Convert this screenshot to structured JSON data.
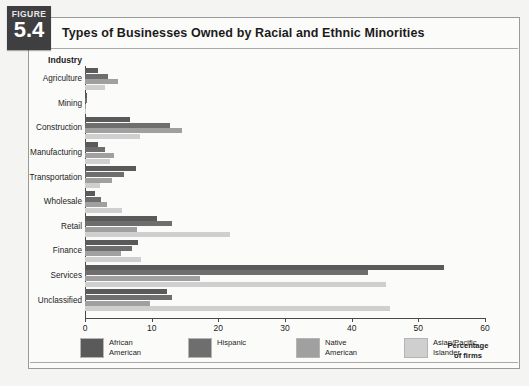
{
  "figure": {
    "word": "FIGURE",
    "number": "5.4",
    "title": "Types of Businesses Owned by Racial and Ethnic Minorities"
  },
  "axis": {
    "y_header": "Industry",
    "x_title": "Percentage\nof firms",
    "x_ticks": [
      "0",
      "10",
      "20",
      "30",
      "40",
      "50",
      "60"
    ]
  },
  "legend": {
    "items": [
      {
        "label": "African\nAmerican",
        "color": "#5a5a5a"
      },
      {
        "label": "Hispanic",
        "color": "#6e6e6e"
      },
      {
        "label": "Native\nAmerican",
        "color": "#a0a0a0"
      },
      {
        "label": "Asian/Pacific\nIslander",
        "color": "#cfcfcf"
      }
    ]
  },
  "chart_data": {
    "type": "bar",
    "orientation": "horizontal",
    "title": "Types of Businesses Owned by Racial and Ethnic Minorities",
    "xlabel": "Percentage of firms",
    "ylabel": "Industry",
    "xlim": [
      0,
      60
    ],
    "xticks": [
      0,
      10,
      20,
      30,
      40,
      50,
      60
    ],
    "grid": false,
    "legend_position": "bottom",
    "categories": [
      "Agriculture",
      "Mining",
      "Construction",
      "Manufacturing",
      "Transportation",
      "Wholesale",
      "Retail",
      "Finance",
      "Services",
      "Unclassified"
    ],
    "series": [
      {
        "name": "African American",
        "color": "#5a5a5a",
        "values": [
          1.9,
          0.3,
          6.8,
          1.9,
          7.6,
          1.5,
          10.8,
          7.9,
          53.8,
          12.3
        ]
      },
      {
        "name": "Hispanic",
        "color": "#6e6e6e",
        "values": [
          3.5,
          0.3,
          12.8,
          3.0,
          5.9,
          2.4,
          13.1,
          7.0,
          42.4,
          13.1
        ]
      },
      {
        "name": "Native American",
        "color": "#a0a0a0",
        "values": [
          5.0,
          0.2,
          14.6,
          4.4,
          4.1,
          3.3,
          7.8,
          5.4,
          17.2,
          9.8
        ]
      },
      {
        "name": "Asian/Pacific Islander",
        "color": "#cfcfcf",
        "values": [
          3.0,
          0.1,
          8.3,
          3.7,
          2.3,
          5.6,
          21.8,
          8.4,
          45.1,
          45.8
        ]
      }
    ]
  }
}
